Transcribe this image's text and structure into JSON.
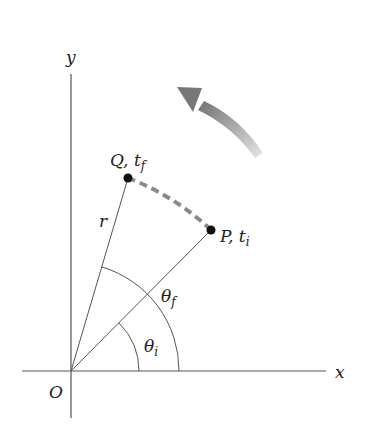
{
  "diagram": {
    "type": "angular-position",
    "axes": {
      "x_label": "x",
      "y_label": "y",
      "origin_label": "O"
    },
    "points": [
      {
        "id": "Q",
        "label": "Q, t",
        "subscript": "f",
        "description": "final position"
      },
      {
        "id": "P",
        "label": "P, t",
        "subscript": "i",
        "description": "initial position"
      }
    ],
    "radius_label": "r",
    "angles": [
      {
        "symbol": "θ",
        "subscript": "i",
        "description": "initial angle"
      },
      {
        "symbol": "θ",
        "subscript": "f",
        "description": "final angle"
      }
    ],
    "motion_arrow": "counterclockwise-rotation-arrow",
    "colors": {
      "lines": "#555555",
      "dashed_path": "#8a8a8a",
      "arrow_dark": "#7a7a7a",
      "arrow_light": "#d8d8d8",
      "points": "#111111",
      "text": "#222222"
    }
  }
}
